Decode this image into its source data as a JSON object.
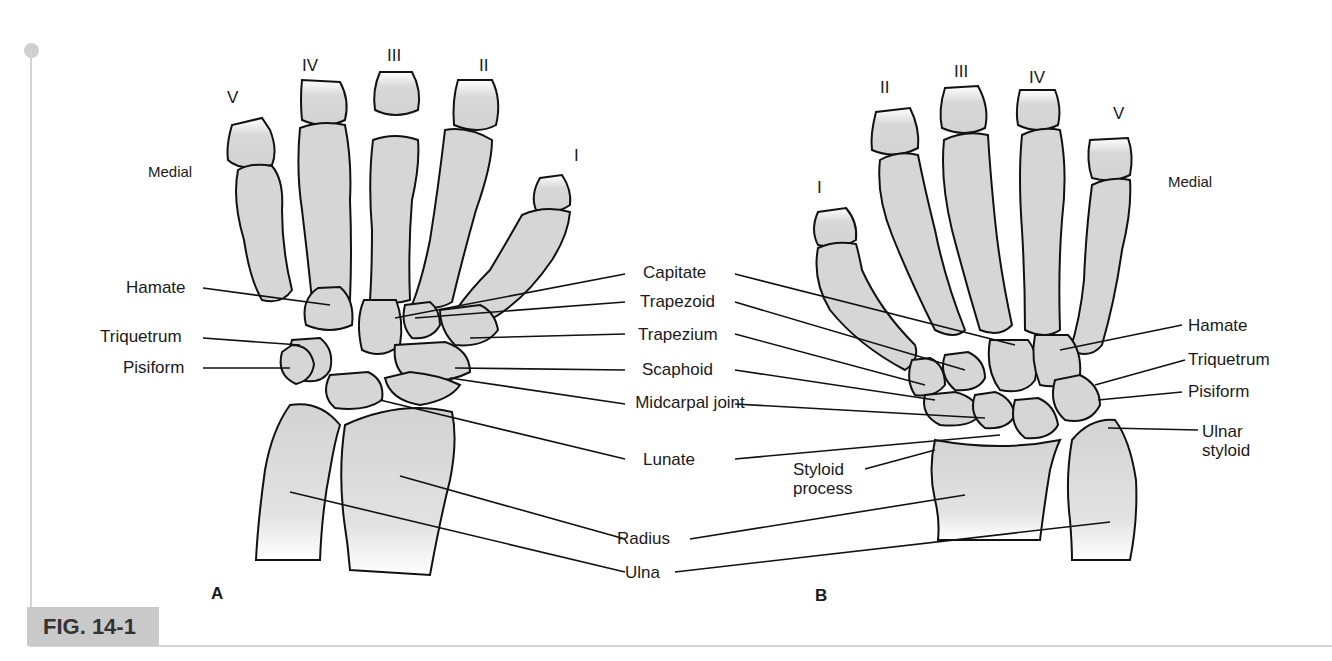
{
  "figure": {
    "caption": "FIG. 14-1",
    "panels": [
      {
        "id": "A",
        "label": "A",
        "side_label": "Medial",
        "digits": [
          "V",
          "IV",
          "III",
          "II",
          "I"
        ],
        "left_labels": [
          "Hamate",
          "Triquetrum",
          "Pisiform"
        ]
      },
      {
        "id": "B",
        "label": "B",
        "side_label": "Medial",
        "digits": [
          "I",
          "II",
          "III",
          "IV",
          "V"
        ],
        "right_labels": [
          "Hamate",
          "Triquetrum",
          "Pisiform",
          "Ulnar styloid"
        ],
        "inner_labels": [
          "Styloid process"
        ]
      }
    ],
    "center_labels": [
      "Capitate",
      "Trapezoid",
      "Trapezium",
      "Scaphoid",
      "Midcarpal joint",
      "Lunate",
      "Radius",
      "Ulna"
    ],
    "colors": {
      "bone_fill": "#d6d6d6",
      "outline": "#111111",
      "caption_bg": "#c9c9c9",
      "rule": "#d4d4d4"
    }
  }
}
